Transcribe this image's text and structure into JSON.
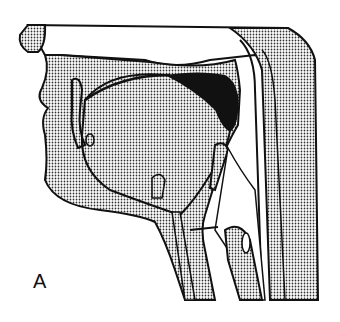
{
  "figure": {
    "panel_label": "A",
    "colors": {
      "outline": "#111111",
      "stipple": "#333333",
      "background": "#ffffff"
    }
  }
}
